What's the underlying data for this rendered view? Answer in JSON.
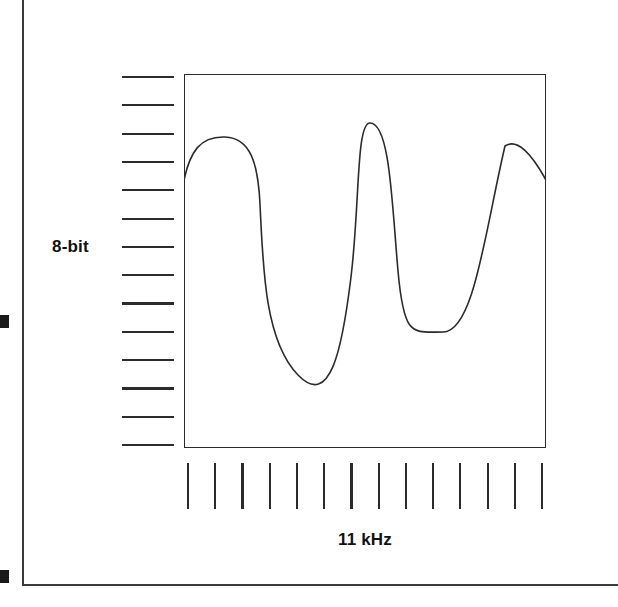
{
  "figure": {
    "background_color": "#ffffff",
    "line_color": "#2b2b2b",
    "marker_color": "#1a1a1a"
  },
  "axes": {
    "y_label": "8-bit",
    "x_label": "11 kHz",
    "y_tick_count": 14,
    "x_tick_count": 14
  },
  "caption_margin": {
    "lines": [
      "e",
      "t",
      "d",
      "a",
      "e",
      "y",
      "t",
      "."
    ]
  },
  "chart_data": {
    "type": "line",
    "title": "",
    "xlabel": "11 kHz",
    "ylabel": "8-bit",
    "grid": false,
    "legend": "none",
    "xlim": [
      0,
      362
    ],
    "ylim": [
      0,
      374
    ],
    "peaks": [
      {
        "x": 41,
        "y": 64
      },
      {
        "x": 186,
        "y": 49
      },
      {
        "x": 321,
        "y": 72
      }
    ],
    "troughs": [
      {
        "x": 114,
        "y": 301
      },
      {
        "x": 259,
        "y": 258
      }
    ],
    "endpoints": [
      {
        "x": 0,
        "y": 106
      },
      {
        "x": 362,
        "y": 106
      }
    ],
    "path": "M 0,106 C 6,78 16,62 41,63 C 66,64 74,88 76,130 C 79,200 82,268 114,301 C 146,334 158,277 167,203 C 176,129 172,49 186,49 C 206,49 208,130 214,197 C 220,264 228,258 259,258 C 290,258 301,157 321,72 C 333,64 347,79 362,106"
  }
}
